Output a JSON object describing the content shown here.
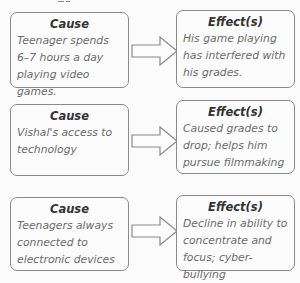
{
  "rows": [
    {
      "cause": {
        "heading": "Cause",
        "text": "Teenager spends 6–7 hours a day playing video games."
      },
      "effect": {
        "heading": "Effect(s)",
        "text": "His game playing has interfered with his grades."
      }
    },
    {
      "cause": {
        "heading": "Cause",
        "text": "Vishal's access to technology"
      },
      "effect": {
        "heading": "Effect(s)",
        "text": "Caused grades to drop; helps him pursue filmmaking"
      }
    },
    {
      "cause": {
        "heading": "Cause",
        "text": "Teenagers always connected to electronic devices"
      },
      "effect": {
        "heading": "Effect(s)",
        "text": "Decline in ability to concentrate and focus; cyber-bullying"
      }
    }
  ],
  "colors": {
    "border": "#8a8a8a",
    "heading": "#333333",
    "text": "#6a6a6a"
  }
}
